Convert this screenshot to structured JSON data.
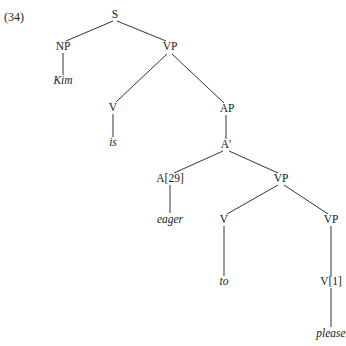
{
  "example_number": "(34)",
  "tree": {
    "nodes": [
      {
        "id": "S",
        "label": "S",
        "x": 115,
        "y": 15,
        "type": "category"
      },
      {
        "id": "NP",
        "label": "NP",
        "x": 63,
        "y": 47,
        "type": "category"
      },
      {
        "id": "Kim",
        "label": "Kim",
        "x": 63,
        "y": 81,
        "type": "word"
      },
      {
        "id": "VP1",
        "label": "VP",
        "x": 170,
        "y": 47,
        "type": "category"
      },
      {
        "id": "V1",
        "label": "V",
        "x": 113,
        "y": 108,
        "type": "category"
      },
      {
        "id": "is",
        "label": "is",
        "x": 113,
        "y": 143,
        "type": "word"
      },
      {
        "id": "AP",
        "label": "AP",
        "x": 227,
        "y": 109,
        "type": "category"
      },
      {
        "id": "Abar",
        "label": "A'",
        "x": 226,
        "y": 145,
        "type": "category"
      },
      {
        "id": "A29",
        "label": "A[29]",
        "x": 170,
        "y": 179,
        "type": "category"
      },
      {
        "id": "eager",
        "label": "eager",
        "x": 170,
        "y": 220,
        "type": "word"
      },
      {
        "id": "VP2",
        "label": "VP",
        "x": 281,
        "y": 179,
        "type": "category"
      },
      {
        "id": "V2",
        "label": "V",
        "x": 224,
        "y": 220,
        "type": "category"
      },
      {
        "id": "to",
        "label": "to",
        "x": 224,
        "y": 282,
        "type": "word"
      },
      {
        "id": "VP3",
        "label": "VP",
        "x": 331,
        "y": 220,
        "type": "category"
      },
      {
        "id": "V1b",
        "label": "V[1]",
        "x": 331,
        "y": 282,
        "type": "category"
      },
      {
        "id": "please",
        "label": "please",
        "x": 331,
        "y": 334,
        "type": "word"
      }
    ],
    "edges": [
      [
        "S",
        "NP"
      ],
      [
        "S",
        "VP1"
      ],
      [
        "NP",
        "Kim"
      ],
      [
        "VP1",
        "V1"
      ],
      [
        "VP1",
        "AP"
      ],
      [
        "V1",
        "is"
      ],
      [
        "AP",
        "Abar"
      ],
      [
        "Abar",
        "A29"
      ],
      [
        "Abar",
        "VP2"
      ],
      [
        "A29",
        "eager"
      ],
      [
        "VP2",
        "V2"
      ],
      [
        "VP2",
        "VP3"
      ],
      [
        "V2",
        "to"
      ],
      [
        "VP3",
        "V1b"
      ],
      [
        "V1b",
        "please"
      ]
    ]
  }
}
